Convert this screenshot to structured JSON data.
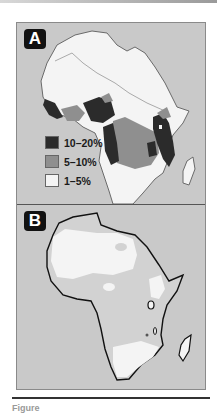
{
  "figure": {
    "panels": [
      {
        "label": "A",
        "legend": [
          {
            "label": "10–20%",
            "color": "#2b2b2b"
          },
          {
            "label": "5–10%",
            "color": "#8f8f8f"
          },
          {
            "label": "1–5%",
            "color": "#f4f4f4"
          }
        ]
      },
      {
        "label": "B"
      }
    ],
    "caption": "Figure"
  },
  "colors": {
    "ocean": "#c9c9c9",
    "dark": "#2b2b2b",
    "mid": "#8f8f8f",
    "light": "#f4f4f4",
    "outline": "#111111"
  }
}
